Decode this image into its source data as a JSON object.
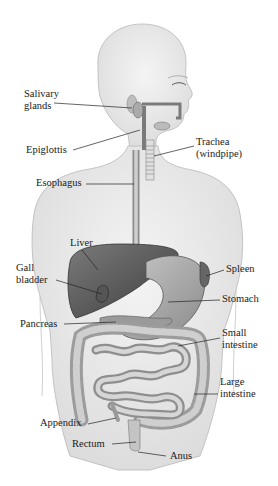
{
  "diagram": {
    "labels": [
      {
        "id": "salivary",
        "text": "Salivary\nglands",
        "lines": [
          "Salivary",
          "glands"
        ],
        "x": 24,
        "y": 88
      },
      {
        "id": "epiglottis",
        "text": "Epiglottis",
        "lines": [
          "Epiglottis"
        ],
        "x": 26,
        "y": 144
      },
      {
        "id": "trachea",
        "text": "Trachea (windpipe)",
        "lines": [
          "Trachea",
          "(windpipe)"
        ],
        "x": 196,
        "y": 136
      },
      {
        "id": "esophagus",
        "text": "Esophagus",
        "lines": [
          "Esophagus"
        ],
        "x": 36,
        "y": 177
      },
      {
        "id": "liver",
        "text": "Liver",
        "lines": [
          "Liver"
        ],
        "x": 70,
        "y": 237
      },
      {
        "id": "gallbladder",
        "text": "Gall bladder",
        "lines": [
          "Gall",
          "bladder"
        ],
        "x": 16,
        "y": 262
      },
      {
        "id": "spleen",
        "text": "Spleen",
        "lines": [
          "Spleen"
        ],
        "x": 226,
        "y": 263
      },
      {
        "id": "stomach",
        "text": "Stomach",
        "lines": [
          "Stomach"
        ],
        "x": 222,
        "y": 293
      },
      {
        "id": "pancreas",
        "text": "Pancreas",
        "lines": [
          "Pancreas"
        ],
        "x": 20,
        "y": 318
      },
      {
        "id": "small_intestine",
        "text": "Small intestine",
        "lines": [
          "Small",
          "intestine"
        ],
        "x": 222,
        "y": 327
      },
      {
        "id": "large_intestine",
        "text": "Large intestine",
        "lines": [
          "Large",
          "intestine"
        ],
        "x": 220,
        "y": 376
      },
      {
        "id": "appendix",
        "text": "Appendix",
        "lines": [
          "Appendix"
        ],
        "x": 40,
        "y": 417
      },
      {
        "id": "rectum",
        "text": "Rectum",
        "lines": [
          "Rectum"
        ],
        "x": 72,
        "y": 438
      },
      {
        "id": "anus",
        "text": "Anus",
        "lines": [
          "Anus"
        ],
        "x": 170,
        "y": 450
      }
    ]
  }
}
